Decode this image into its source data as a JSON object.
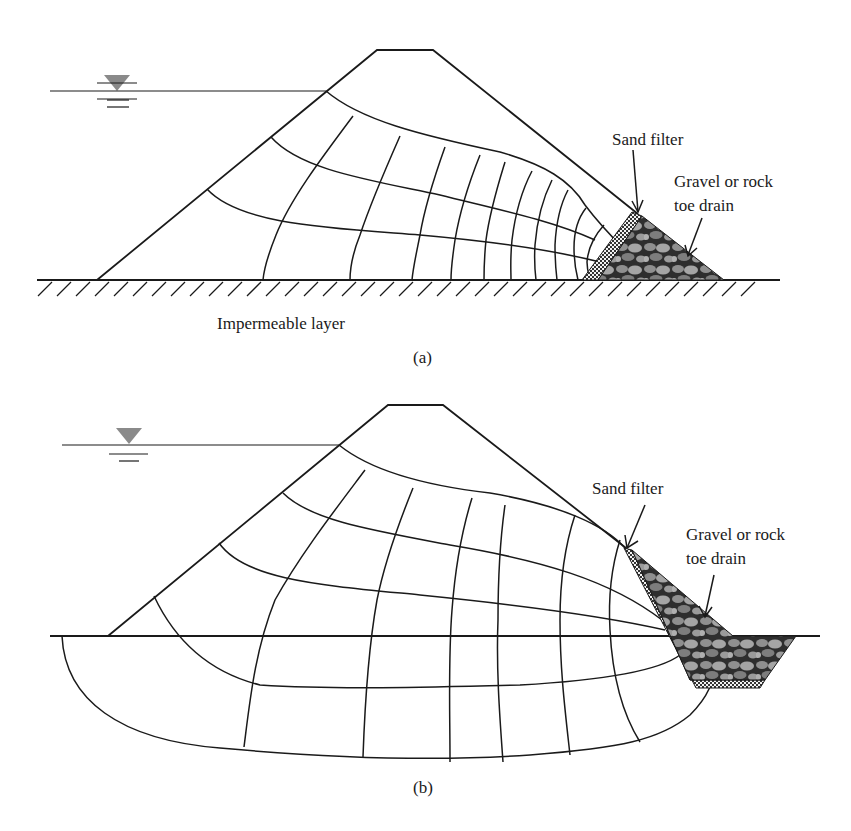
{
  "figure_a": {
    "caption": "(a)",
    "labels": {
      "sand_filter": "Sand filter",
      "toe_drain_line1": "Gravel or rock",
      "toe_drain_line2": "toe drain",
      "impermeable": "Impermeable layer"
    }
  },
  "figure_b": {
    "caption": "(b)",
    "labels": {
      "sand_filter": "Sand filter",
      "toe_drain_line1": "Gravel or rock",
      "toe_drain_line2": "toe drain"
    }
  },
  "colors": {
    "line": "#1a1a1a",
    "water_symbol": "#8a8a8a",
    "gravel_dark": "#3a3a3a",
    "gravel_light": "#9a9a9a",
    "sand": "#e8e8e8"
  }
}
